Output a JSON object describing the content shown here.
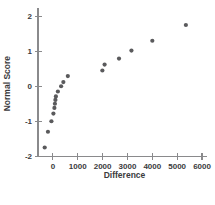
{
  "chart_data": {
    "type": "scatter",
    "title": "",
    "xlabel": "Difference",
    "ylabel": "Normal Score",
    "xlim": [
      -600,
      6200
    ],
    "ylim": [
      -2.25,
      2.15
    ],
    "xticks": [
      0,
      1000,
      2000,
      3000,
      4000,
      5000,
      6000
    ],
    "xtick_labels": [
      "0",
      "1000",
      "2000",
      "3000",
      "4000",
      "5000",
      "6000"
    ],
    "yticks": [
      -2,
      -1,
      0,
      1,
      2
    ],
    "ytick_labels": [
      "-2",
      "-1",
      "0",
      "1",
      "2"
    ],
    "grid": false,
    "legend": null,
    "marker_color": "#5a5a5c",
    "marker_size": 2.1,
    "axis_color": "#8a8a8c",
    "points": [
      {
        "x": -330,
        "y": -1.75
      },
      {
        "x": -200,
        "y": -1.3
      },
      {
        "x": -60,
        "y": -1.0
      },
      {
        "x": 20,
        "y": -0.78
      },
      {
        "x": 60,
        "y": -0.62
      },
      {
        "x": 80,
        "y": -0.5
      },
      {
        "x": 100,
        "y": -0.39
      },
      {
        "x": 120,
        "y": -0.29
      },
      {
        "x": 200,
        "y": -0.15
      },
      {
        "x": 330,
        "y": 0.0
      },
      {
        "x": 420,
        "y": 0.12
      },
      {
        "x": 600,
        "y": 0.29
      },
      {
        "x": 1990,
        "y": 0.45
      },
      {
        "x": 2080,
        "y": 0.62
      },
      {
        "x": 2660,
        "y": 0.79
      },
      {
        "x": 3160,
        "y": 1.02
      },
      {
        "x": 4000,
        "y": 1.3
      },
      {
        "x": 5350,
        "y": 1.75
      }
    ]
  },
  "labels": {
    "x_axis_title": "Difference",
    "y_axis_title": "Normal Score"
  }
}
